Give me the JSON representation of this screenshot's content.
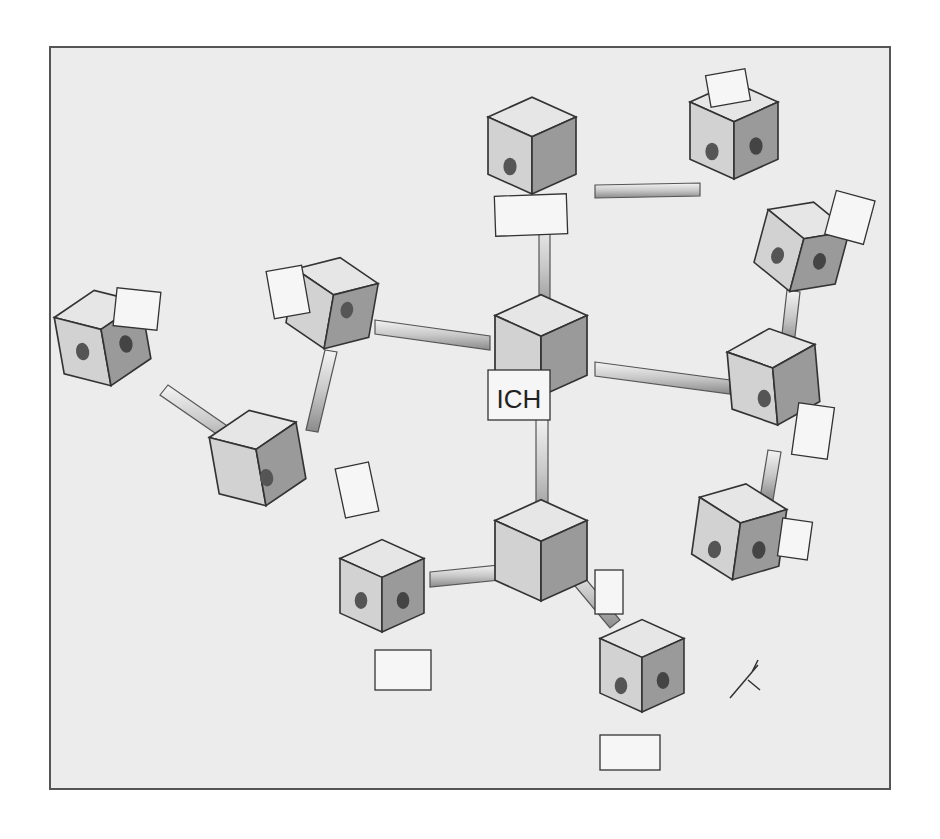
{
  "illustration": {
    "description": "Hand-drawn sketch of a network of cubes connected by rods, with a central cube labeled ICH",
    "center_label": "ICH",
    "colors": {
      "background": "#ececec",
      "frame": "#555555",
      "cube_light": "#e4e4e4",
      "cube_mid": "#bdbdbd",
      "cube_dark": "#8e8e8e",
      "ink": "#2a2a2a"
    },
    "cube_count": 13,
    "signature": "artist mark bottom right"
  }
}
